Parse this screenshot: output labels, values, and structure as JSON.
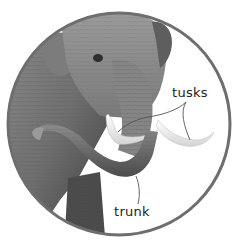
{
  "figure": {
    "frame_color": "#6e6e6e",
    "background": "#ffffff"
  },
  "labels": {
    "tusks": "tusks",
    "trunk": "trunk"
  },
  "leader_line_color": "#555555"
}
